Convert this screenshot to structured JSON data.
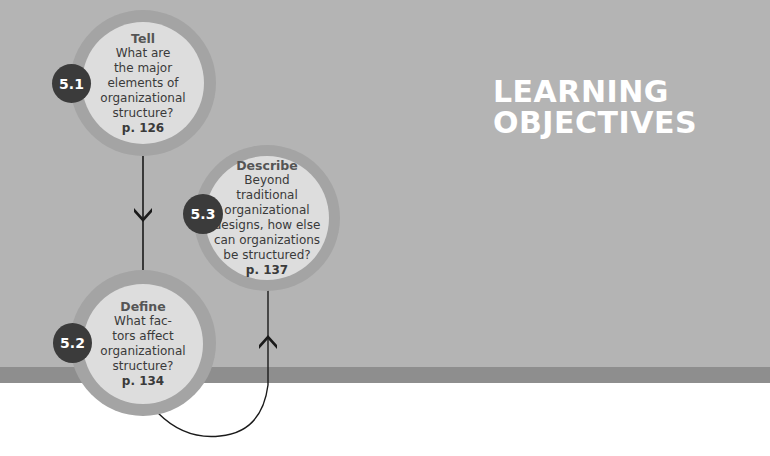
{
  "header": {
    "title_line1": "LEARNING",
    "title_line2": "OBJECTIVES"
  },
  "objectives": [
    {
      "number": "5.1",
      "verb": "Tell",
      "lines": [
        "What are",
        "the major",
        "elements of",
        "organizational",
        "structure?"
      ],
      "page": "p. 126"
    },
    {
      "number": "5.2",
      "verb": "Define",
      "lines": [
        "What fac-",
        "tors affect",
        "organizational",
        "structure?"
      ],
      "page": "p. 134"
    },
    {
      "number": "5.3",
      "verb": "Describe",
      "lines": [
        "Beyond",
        "traditional",
        "organizational",
        "designs, how else",
        "can organizations",
        "be structured?"
      ],
      "page": "p. 137"
    }
  ],
  "connectors": {
    "down_arrow_icon": "chevron-down",
    "up_arrow_icon": "chevron-up"
  },
  "colors": {
    "background_gray": "#b4b4b4",
    "band_gray": "#8e8e8e",
    "circle_ring": "#a4a4a4",
    "circle_fill": "#dddddd",
    "badge": "#3b3b3b",
    "title": "#ffffff"
  }
}
